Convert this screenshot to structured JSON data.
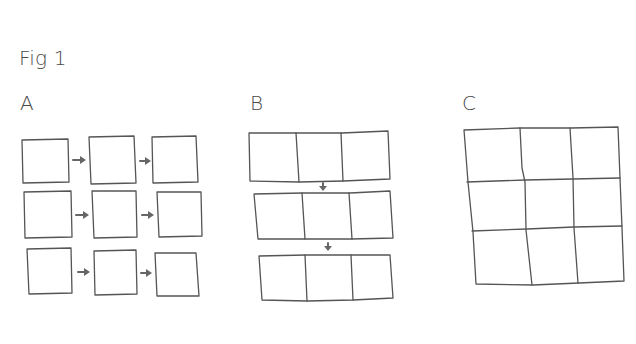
{
  "figure": {
    "title": "Fig 1",
    "panels": [
      {
        "label": "A",
        "description": "3x3 separate squares, each row connected left-to-right by arrows",
        "rows": 3,
        "cols": 3,
        "arrow_direction": "right"
      },
      {
        "label": "B",
        "description": "3 horizontal strips of 3 joined cells, strips connected top-to-bottom by arrows",
        "rows": 3,
        "cols": 3,
        "arrow_direction": "down"
      },
      {
        "label": "C",
        "description": "single 3x3 grid of joined cells",
        "rows": 3,
        "cols": 3,
        "arrow_direction": "none"
      }
    ]
  },
  "colors": {
    "stroke": "#555555",
    "arrow": "#666666",
    "text": "#4a4a4a",
    "background": "#ffffff"
  }
}
